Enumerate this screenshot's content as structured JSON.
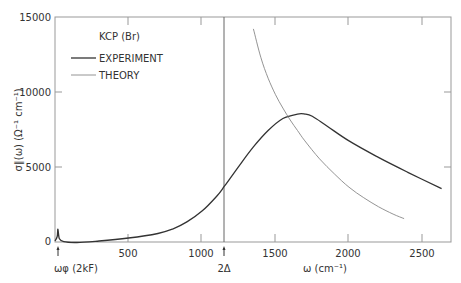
{
  "chart_data": {
    "type": "line",
    "title": "KCP (Br)",
    "xlabel": "ω (cm⁻¹)",
    "ylabel": "σ∥(ω) (Ω⁻¹ cm⁻¹)",
    "xlim": [
      0,
      2700
    ],
    "ylim": [
      0,
      15000
    ],
    "x_ticks": [
      500,
      1000,
      1500,
      2000,
      2500
    ],
    "y_ticks": [
      0,
      5000,
      10000,
      15000
    ],
    "grid": false,
    "legend_position": "upper-left",
    "annotations": [
      {
        "text": "ωφ (2kF)",
        "x": 20,
        "marker": "arrow-up"
      },
      {
        "text": "2Δ",
        "x": 1155,
        "marker": "arrow-up",
        "vertical_line": true
      }
    ],
    "series": [
      {
        "name": "EXPERIMENT",
        "style": "dark",
        "x": [
          0,
          15,
          20,
          30,
          60,
          150,
          300,
          500,
          700,
          800,
          900,
          1000,
          1100,
          1155,
          1250,
          1350,
          1450,
          1550,
          1650,
          1700,
          1750,
          1850,
          2000,
          2200,
          2400,
          2630
        ],
        "y": [
          0,
          300,
          800,
          150,
          -50,
          -100,
          0,
          200,
          500,
          800,
          1300,
          2000,
          3000,
          3700,
          5000,
          6300,
          7400,
          8200,
          8500,
          8500,
          8350,
          7700,
          6700,
          5600,
          4600,
          3500
        ]
      },
      {
        "name": "THEORY",
        "style": "light",
        "x": [
          1350,
          1400,
          1450,
          1500,
          1550,
          1600,
          1650,
          1700,
          1800,
          1900,
          2000,
          2100,
          2200,
          2300,
          2375
        ],
        "y": [
          14200,
          12300,
          10900,
          9800,
          8900,
          8100,
          7400,
          6700,
          5500,
          4500,
          3600,
          2900,
          2300,
          1800,
          1500
        ]
      }
    ]
  },
  "legend": {
    "title": "KCP (Br)",
    "items": [
      {
        "label": "EXPERIMENT"
      },
      {
        "label": "THEORY"
      }
    ]
  },
  "axes": {
    "y_tick_labels": [
      "0",
      "5000",
      "10000",
      "15000"
    ],
    "x_tick_labels": [
      "500",
      "1000",
      "1500",
      "2000",
      "2500"
    ],
    "x_label": "ω (cm⁻¹)",
    "y_label": "σ∥(ω) (Ω⁻¹ cm⁻¹)",
    "omega_phonon_label": "ωφ (2kF)",
    "gap_label": "2Δ"
  }
}
